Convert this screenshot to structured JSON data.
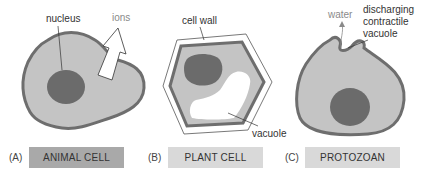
{
  "panels": [
    {
      "letter": "(A)",
      "title": "ANIMAL CELL",
      "title_bg": "#a9a9a9",
      "labels": {
        "nucleus": "nucleus",
        "ions": "ions"
      }
    },
    {
      "letter": "(B)",
      "title": "PLANT CELL",
      "title_bg": "#d9d9d9",
      "labels": {
        "cell_wall": "cell wall",
        "vacuole": "vacuole"
      }
    },
    {
      "letter": "(C)",
      "title": "PROTOZOAN",
      "title_bg": "#d9d9d9",
      "labels": {
        "water": "water",
        "cv_line1": "discharging",
        "cv_line2": "contractile",
        "cv_line3": "vacuole"
      }
    }
  ],
  "colors": {
    "cytoplasm": "#c4c4c4",
    "membrane": "#6e6e6e",
    "nucleus": "#6b6b6b",
    "wall_fill": "#ffffff",
    "vacuole": "#ffffff"
  }
}
